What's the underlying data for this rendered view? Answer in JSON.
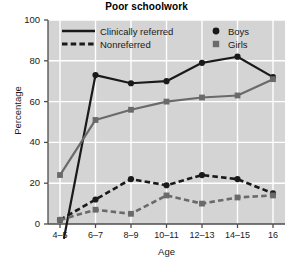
{
  "chart_data": {
    "type": "line",
    "title": "Poor schoolwork",
    "xlabel": "Age",
    "ylabel": "Percentage",
    "categories": [
      "4–5",
      "6–7",
      "8–9",
      "10–11",
      "12–13",
      "14–15",
      "16"
    ],
    "ylim": [
      0,
      100
    ],
    "yticks": [
      0,
      20,
      40,
      60,
      80,
      100
    ],
    "grid": true,
    "legend_position": "top-inside",
    "legend": {
      "line_styles": [
        {
          "label": "Clinically referred",
          "style": "solid"
        },
        {
          "label": "Nonreferred",
          "style": "dashed"
        }
      ],
      "markers": [
        {
          "label": "Boys",
          "marker": "circle",
          "color": "#1a1a1a"
        },
        {
          "label": "Girls",
          "marker": "square",
          "color": "#6a6a6a"
        }
      ]
    },
    "series": [
      {
        "name": "Clinically referred Boys",
        "style": "solid",
        "marker": "circle",
        "color": "#1a1a1a",
        "values": [
          null,
          73,
          69,
          70,
          79,
          82,
          72
        ]
      },
      {
        "name": "Clinically referred Girls",
        "style": "solid",
        "marker": "square",
        "color": "#6a6a6a",
        "values": [
          24,
          51,
          56,
          60,
          62,
          63,
          71
        ]
      },
      {
        "name": "Nonreferred Boys",
        "style": "dashed",
        "marker": "circle",
        "color": "#1a1a1a",
        "values": [
          2,
          12,
          22,
          19,
          24,
          22,
          15
        ]
      },
      {
        "name": "Nonreferred Girls",
        "style": "dashed",
        "marker": "square",
        "color": "#6a6a6a",
        "values": [
          2,
          7,
          5,
          14,
          10,
          13,
          14
        ]
      }
    ],
    "colors": {
      "plot_background": "#d4d4d4",
      "gridline": "#ffffff",
      "axis": "#4d4d4d",
      "boys": "#1a1a1a",
      "girls": "#6a6a6a",
      "page_background": "#ffffff"
    }
  }
}
